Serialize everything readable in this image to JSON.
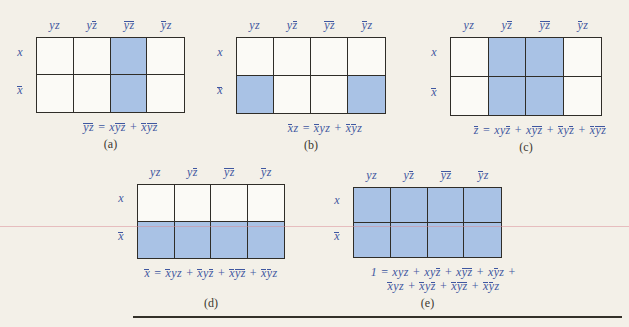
{
  "page": {
    "colors": {
      "background": "#f3f0e8",
      "math_blue": "#3f57a0",
      "cell_shade": "#a9c2e5",
      "cell_white": "#fbfaf6",
      "grid_border": "#2f2d28",
      "caption_text": "#3b382f",
      "rule_line": "#343129",
      "scan_artifact_pink": "#d98c96"
    }
  },
  "figure": {
    "maps": [
      {
        "id": "a",
        "caption": "(a)",
        "headers": [
          [
            [
              "yz",
              false
            ]
          ],
          [
            [
              "y",
              false
            ],
            [
              "z",
              true
            ]
          ],
          [
            [
              "yz",
              true
            ]
          ],
          [
            [
              "y",
              true
            ],
            [
              "z",
              false
            ]
          ]
        ],
        "row_labels": [
          [
            [
              "x",
              false
            ]
          ],
          [
            [
              "x",
              true
            ]
          ]
        ],
        "cells": [
          [
            false,
            false,
            true,
            false
          ],
          [
            false,
            false,
            true,
            false
          ]
        ],
        "expr_lines": [
          [
            [
              "yz",
              true
            ],
            [
              " = ",
              false
            ],
            [
              "x",
              false
            ],
            [
              "yz",
              true
            ],
            [
              " + ",
              false
            ],
            [
              "x",
              true
            ],
            [
              "yz",
              true
            ]
          ]
        ]
      },
      {
        "id": "b",
        "caption": "(b)",
        "headers": [
          [
            [
              "yz",
              false
            ]
          ],
          [
            [
              "y",
              false
            ],
            [
              "z",
              true
            ]
          ],
          [
            [
              "yz",
              true
            ]
          ],
          [
            [
              "y",
              true
            ],
            [
              "z",
              false
            ]
          ]
        ],
        "row_labels": [
          [
            [
              "x",
              false
            ]
          ],
          [
            [
              "x",
              true
            ]
          ]
        ],
        "cells": [
          [
            false,
            false,
            false,
            false
          ],
          [
            true,
            false,
            false,
            true
          ]
        ],
        "expr_lines": [
          [
            [
              "x",
              true
            ],
            [
              "z",
              false
            ],
            [
              " = ",
              false
            ],
            [
              "x",
              true
            ],
            [
              "yz",
              false
            ],
            [
              " + ",
              false
            ],
            [
              "x",
              true
            ],
            [
              "y",
              true
            ],
            [
              "z",
              false
            ]
          ]
        ]
      },
      {
        "id": "c",
        "caption": "(c)",
        "headers": [
          [
            [
              "yz",
              false
            ]
          ],
          [
            [
              "y",
              false
            ],
            [
              "z",
              true
            ]
          ],
          [
            [
              "yz",
              true
            ]
          ],
          [
            [
              "y",
              true
            ],
            [
              "z",
              false
            ]
          ]
        ],
        "row_labels": [
          [
            [
              "x",
              false
            ]
          ],
          [
            [
              "x",
              true
            ]
          ]
        ],
        "cells": [
          [
            false,
            true,
            true,
            false
          ],
          [
            false,
            true,
            true,
            false
          ]
        ],
        "expr_lines": [
          [
            [
              "z",
              true
            ],
            [
              " = ",
              false
            ],
            [
              "xy",
              false
            ],
            [
              "z",
              true
            ],
            [
              " + ",
              false
            ],
            [
              "x",
              false
            ],
            [
              "yz",
              true
            ],
            [
              " + ",
              false
            ],
            [
              "x",
              true
            ],
            [
              "y",
              false
            ],
            [
              "z",
              true
            ],
            [
              " + ",
              false
            ],
            [
              "x",
              true
            ],
            [
              "yz",
              true
            ]
          ]
        ]
      },
      {
        "id": "d",
        "caption": "(d)",
        "headers": [
          [
            [
              "yz",
              false
            ]
          ],
          [
            [
              "y",
              false
            ],
            [
              "z",
              true
            ]
          ],
          [
            [
              "yz",
              true
            ]
          ],
          [
            [
              "y",
              true
            ],
            [
              "z",
              false
            ]
          ]
        ],
        "row_labels": [
          [
            [
              "x",
              false
            ]
          ],
          [
            [
              "x",
              true
            ]
          ]
        ],
        "cells": [
          [
            false,
            false,
            false,
            false
          ],
          [
            true,
            true,
            true,
            true
          ]
        ],
        "expr_lines": [
          [
            [
              "x",
              true
            ],
            [
              " = ",
              false
            ],
            [
              "x",
              true
            ],
            [
              "yz",
              false
            ],
            [
              " + ",
              false
            ],
            [
              "x",
              true
            ],
            [
              "y",
              false
            ],
            [
              "z",
              true
            ],
            [
              " + ",
              false
            ],
            [
              "x",
              true
            ],
            [
              "yz",
              true
            ],
            [
              " + ",
              false
            ],
            [
              "x",
              true
            ],
            [
              "y",
              true
            ],
            [
              "z",
              false
            ]
          ]
        ]
      },
      {
        "id": "e",
        "caption": "(e)",
        "headers": [
          [
            [
              "yz",
              false
            ]
          ],
          [
            [
              "y",
              false
            ],
            [
              "z",
              true
            ]
          ],
          [
            [
              "yz",
              true
            ]
          ],
          [
            [
              "y",
              true
            ],
            [
              "z",
              false
            ]
          ]
        ],
        "row_labels": [
          [
            [
              "x",
              false
            ]
          ],
          [
            [
              "x",
              true
            ]
          ]
        ],
        "cells": [
          [
            true,
            true,
            true,
            true
          ],
          [
            true,
            true,
            true,
            true
          ]
        ],
        "expr_lines": [
          [
            [
              "1 = ",
              false
            ],
            [
              "xyz",
              false
            ],
            [
              " + ",
              false
            ],
            [
              "xy",
              false
            ],
            [
              "z",
              true
            ],
            [
              " + ",
              false
            ],
            [
              "x",
              false
            ],
            [
              "yz",
              true
            ],
            [
              " + ",
              false
            ],
            [
              "x",
              false
            ],
            [
              "y",
              true
            ],
            [
              "z",
              false
            ],
            [
              " +",
              false
            ]
          ],
          [
            [
              "x",
              true
            ],
            [
              "yz",
              false
            ],
            [
              " + ",
              false
            ],
            [
              "x",
              true
            ],
            [
              "y",
              false
            ],
            [
              "z",
              true
            ],
            [
              " + ",
              false
            ],
            [
              "x",
              true
            ],
            [
              "yz",
              true
            ],
            [
              " + ",
              false
            ],
            [
              "x",
              true
            ],
            [
              "y",
              true
            ],
            [
              "z",
              false
            ]
          ]
        ]
      }
    ]
  }
}
